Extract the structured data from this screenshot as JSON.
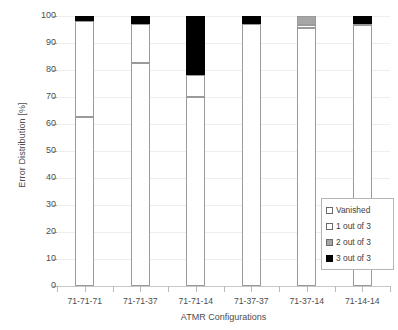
{
  "chart_data": {
    "type": "bar",
    "subtype": "stacked-bar",
    "title": "",
    "xlabel": "ATMR Configurations",
    "ylabel": "Error Distribution [%]",
    "ylim": [
      0,
      100
    ],
    "ytick_step": 10,
    "yticks": [
      100,
      90,
      80,
      70,
      60,
      50,
      40,
      30,
      20,
      10,
      0
    ],
    "grid": true,
    "grid_axis": "y",
    "legend_position": "inside-bottom-right",
    "categories": [
      "71-71-71",
      "71-71-37",
      "71-71-14",
      "71-37-37",
      "71-37-14",
      "71-14-14"
    ],
    "series": [
      {
        "name": "Vanished",
        "color": "#FFFFFF",
        "values": [
          62.5,
          82.5,
          70.0,
          97.0,
          95.5,
          96.5
        ]
      },
      {
        "name": "1 out of 3",
        "color": "#FFFFFF",
        "values": [
          35.5,
          14.5,
          8.0,
          0.0,
          1.0,
          0.5
        ]
      },
      {
        "name": "2 out of 3",
        "color": "#A6A6A6",
        "values": [
          0.0,
          0.0,
          0.0,
          0.0,
          3.5,
          0.0
        ]
      },
      {
        "name": "3 out of 3",
        "color": "#000000",
        "values": [
          2.0,
          3.0,
          22.0,
          3.0,
          0.0,
          3.0
        ]
      }
    ]
  },
  "legend": {
    "items": [
      {
        "label": "Vanished",
        "swatch": "white-square-icon"
      },
      {
        "label": "1 out of 3",
        "swatch": "white-square-icon"
      },
      {
        "label": "2 out of 3",
        "swatch": "gray-square-icon"
      },
      {
        "label": "3 out of 3",
        "swatch": "black-square-icon"
      }
    ]
  },
  "colors": {
    "vanished": "#FFFFFF",
    "one_of_three": "#FFFFFF",
    "two_of_three": "#A6A6A6",
    "three_of_three": "#000000",
    "gridline": "#EEEEEE",
    "axis": "#C8C8C8",
    "text": "#4D4D4D"
  }
}
